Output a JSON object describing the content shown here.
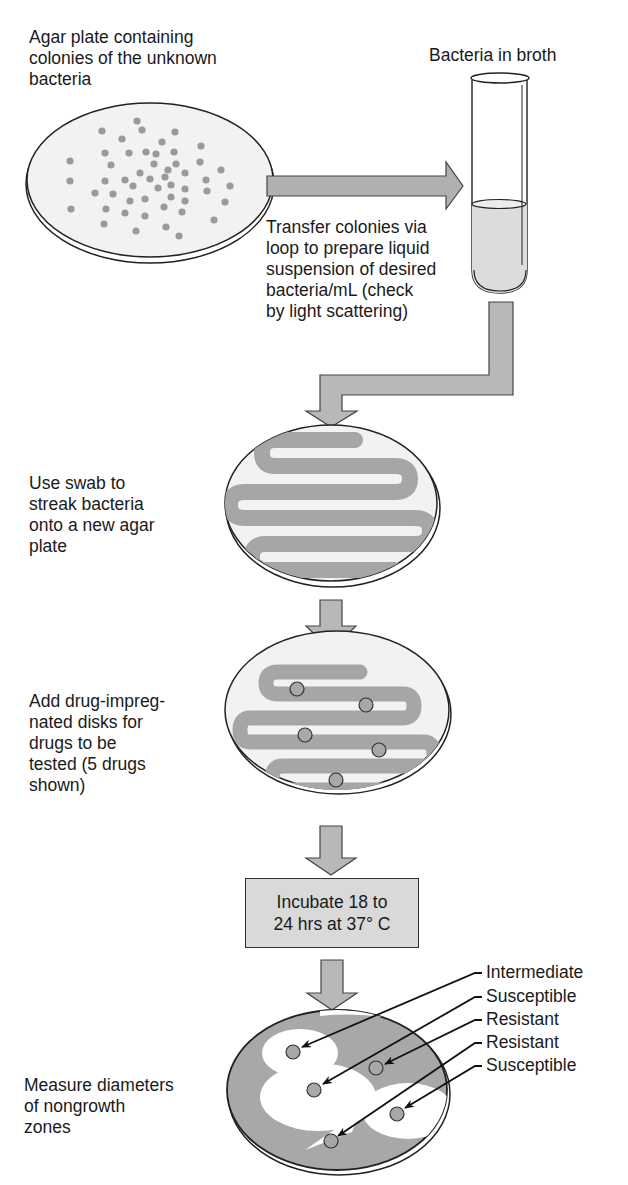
{
  "steps": {
    "agar_plate_label": "Agar plate containing\ncolonies of the unknown\nbacteria",
    "broth_label": "Bacteria in broth",
    "transfer_label": "Transfer colonies via\nloop to prepare liquid\nsuspension of desired\nbacteria/mL (check\nby light scattering)",
    "swab_label": "Use swab to\nstreak bacteria\nonto a new agar\nplate",
    "disks_label": "Add drug-impreg-\nnated disks for\ndrugs to be\ntested (5 drugs\nshown)",
    "incubate_label": "Incubate 18 to\n24 hrs at 37° C",
    "measure_label": "Measure diameters\nof nongrowth\nzones"
  },
  "results": [
    {
      "label": "Intermediate"
    },
    {
      "label": "Susceptible"
    },
    {
      "label": "Resistant"
    },
    {
      "label": "Resistant"
    },
    {
      "label": "Susceptible"
    }
  ],
  "colors": {
    "fill_gray": "#a8a8a8",
    "light_gray": "#d6d6d6",
    "outline": "#222222"
  }
}
